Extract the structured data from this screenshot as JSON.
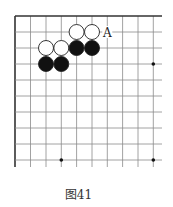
{
  "diagram": {
    "type": "go-board-fragment",
    "caption": "图41",
    "grid": {
      "x_lines": [
        15,
        30.5,
        46,
        61.3,
        76.6,
        92,
        107.3,
        122.6,
        138,
        153.3
      ],
      "y_lines": [
        16,
        32,
        48,
        64,
        80,
        96,
        112,
        128,
        144,
        160
      ],
      "x_extent": [
        15,
        162
      ],
      "y_extent": [
        16,
        167
      ],
      "line_color": "#8a8a8a",
      "border_color": "#333333"
    },
    "stones": [
      {
        "color": "white",
        "col": 4,
        "row": 1
      },
      {
        "color": "white",
        "col": 5,
        "row": 1
      },
      {
        "color": "white",
        "col": 2,
        "row": 2
      },
      {
        "color": "white",
        "col": 3,
        "row": 2
      },
      {
        "color": "black",
        "col": 4,
        "row": 2
      },
      {
        "color": "black",
        "col": 5,
        "row": 2
      },
      {
        "color": "black",
        "col": 2,
        "row": 3
      },
      {
        "color": "black",
        "col": 3,
        "row": 3
      }
    ],
    "labels": [
      {
        "text": "A",
        "col": 6,
        "row": 1
      }
    ],
    "star_points": [
      {
        "col": 9,
        "row": 3
      },
      {
        "col": 3,
        "row": 9
      },
      {
        "col": 9,
        "row": 9
      }
    ],
    "stone_radius": 7.5
  }
}
